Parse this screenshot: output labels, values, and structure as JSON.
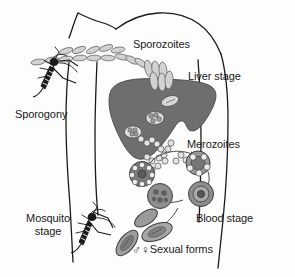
{
  "figure": {
    "background_color": "#fdfdfd",
    "outline_color": "#1a1a1a",
    "liver_color": "#6e6e6e",
    "cell_color": "#8c8c8c",
    "text_color": "#1a1a1a"
  },
  "labels": {
    "sporozoites": "Sporozoites",
    "liver_stage": "Liver stage",
    "sporogony": "Sporogony",
    "merozoites": "Merozoites",
    "mosquito_stage_line1": "Mosquito",
    "mosquito_stage_line2": "stage",
    "blood_stage": "Blood stage",
    "sexual_forms": "Sexual forms",
    "male_symbol": "♂",
    "female_symbol": "♀"
  },
  "elements": {
    "human_torso": "human-torso-outline",
    "liver": "liver-organ",
    "mosquito_upper": "mosquito-biting-arm-upper",
    "mosquito_lower": "mosquito-biting-arm-lower",
    "sporozoite_chain": "sporozoite-spindle-chain",
    "merozoite_chain": "merozoite-circle-chain",
    "blood_cycle": "blood-stage-cycle",
    "gametocytes": "gametocyte-banana-forms"
  }
}
